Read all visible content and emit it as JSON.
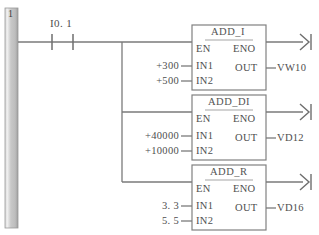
{
  "diagram": {
    "type": "plc-ladder-logic",
    "network_number": "1",
    "power_rail": {
      "name": "left-power-rail",
      "color": "#b7b7b7"
    },
    "contact": {
      "label": "I0. 1",
      "type": "normally-open-contact"
    },
    "line_color": "#6e6e6e",
    "blocks": [
      {
        "title": "ADD_I",
        "pins": {
          "en": "EN",
          "eno": "ENO",
          "in1": "IN1",
          "in2": "IN2",
          "out": "OUT"
        },
        "in1_value": "+300",
        "in2_value": "+500",
        "out_value": "VW10"
      },
      {
        "title": "ADD_DI",
        "pins": {
          "en": "EN",
          "eno": "ENO",
          "in1": "IN1",
          "in2": "IN2",
          "out": "OUT"
        },
        "in1_value": "+40000",
        "in2_value": "+10000",
        "out_value": "VD12"
      },
      {
        "title": "ADD_R",
        "pins": {
          "en": "EN",
          "eno": "ENO",
          "in1": "IN1",
          "in2": "IN2",
          "out": "OUT"
        },
        "in1_value": "3. 3",
        "in2_value": "5. 5",
        "out_value": "VD16"
      }
    ]
  }
}
